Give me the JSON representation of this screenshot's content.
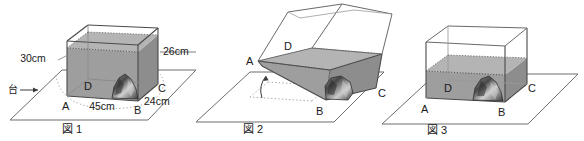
{
  "document": {
    "kind": "math-diagram",
    "language": "ja",
    "description": "Three figures of a rectangular water tank on a stand"
  },
  "palette": {
    "ink": "#1a1a1a",
    "outline": "#4a4a4a",
    "thin_outline": "#7a7a7a",
    "water_fill": "#9e9e9e",
    "water_fill_light": "#b0b0b0",
    "water_fill_dark": "#8d8d8d",
    "rock_dark": "#3c3c3c",
    "rock_mid": "#6e6e6e",
    "rock_light": "#c8c8c8",
    "plane_line": "#6d6d6d",
    "dotted": "#9a9a9a",
    "background": "#ffffff"
  },
  "figures": [
    {
      "id": "figure-1",
      "caption": "図 1",
      "state": "upright-full",
      "vertices": {
        "a": "A",
        "b": "B",
        "c": "C",
        "d": "D"
      },
      "dimensions": [
        {
          "name": "height",
          "label": "30cm",
          "value": 30,
          "unit": "cm"
        },
        {
          "name": "rear-height",
          "label": "26cm",
          "value": 26,
          "unit": "cm"
        },
        {
          "name": "width",
          "label": "45cm",
          "value": 45,
          "unit": "cm"
        },
        {
          "name": "depth",
          "label": "24cm",
          "value": 24,
          "unit": "cm"
        }
      ],
      "annotations": [
        {
          "name": "stand-pointer",
          "label": "台",
          "arrow": "→"
        }
      ],
      "contents": [
        "water",
        "rock"
      ]
    },
    {
      "id": "figure-2",
      "caption": "図 2",
      "state": "tilted",
      "vertices": {
        "a": "A",
        "b": "B",
        "c": "C",
        "d": "D"
      },
      "dimensions": [],
      "annotations": [
        {
          "name": "rotation-arrow",
          "label": ""
        }
      ],
      "contents": [
        "water",
        "rock"
      ]
    },
    {
      "id": "figure-3",
      "caption": "図 3",
      "state": "upright-lower",
      "vertices": {
        "a": "A",
        "b": "B",
        "c": "C",
        "d": "D"
      },
      "dimensions": [],
      "annotations": [],
      "contents": [
        "water",
        "rock"
      ]
    }
  ]
}
